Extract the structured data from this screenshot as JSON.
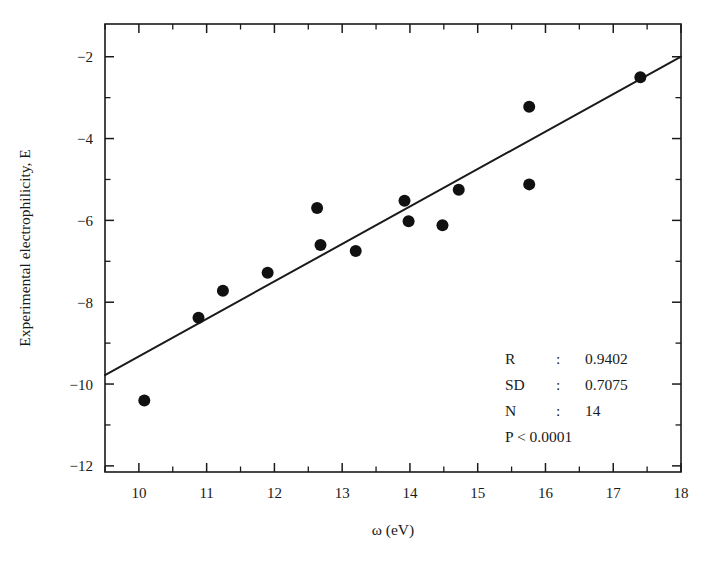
{
  "chart_data": {
    "type": "scatter",
    "title": "",
    "xlabel": "ω (eV)",
    "ylabel": "Experimental electrophilicity, E",
    "xlim": [
      9.5,
      18.0
    ],
    "ylim": [
      -12.15,
      -1.2
    ],
    "grid": false,
    "legend": "none",
    "xticks": [
      10,
      11,
      12,
      13,
      14,
      15,
      16,
      17,
      18
    ],
    "xtick_labels": [
      "10",
      "11",
      "12",
      "13",
      "14",
      "15",
      "16",
      "17",
      "18"
    ],
    "xminor_step": 0.5,
    "yticks": [
      -2,
      -4,
      -6,
      -8,
      -10,
      -12
    ],
    "ytick_labels": [
      "−2",
      "−4",
      "−6",
      "−8",
      "−10",
      "−12"
    ],
    "yminor_step": 1,
    "marker": "filled-circle",
    "marker_color": "#111111",
    "line_color": "#1a1a1a",
    "series": [
      {
        "name": "Experimental vs ω",
        "points": [
          {
            "x": 10.08,
            "y": -10.4
          },
          {
            "x": 10.88,
            "y": -8.38
          },
          {
            "x": 11.24,
            "y": -7.72
          },
          {
            "x": 11.9,
            "y": -7.28
          },
          {
            "x": 12.63,
            "y": -5.7
          },
          {
            "x": 12.68,
            "y": -6.6
          },
          {
            "x": 13.2,
            "y": -6.75
          },
          {
            "x": 13.92,
            "y": -5.52
          },
          {
            "x": 13.98,
            "y": -6.02
          },
          {
            "x": 14.48,
            "y": -6.12
          },
          {
            "x": 14.72,
            "y": -5.25
          },
          {
            "x": 15.76,
            "y": -3.22
          },
          {
            "x": 15.76,
            "y": -5.12
          },
          {
            "x": 17.4,
            "y": -2.5
          }
        ]
      }
    ],
    "fit_line": {
      "name": "linear regression",
      "x_start": 9.5,
      "y_start": -9.78,
      "x_end": 18.0,
      "y_end": -2.0
    }
  },
  "stats": {
    "rows": [
      {
        "label": "R",
        "sep": ":",
        "value": "0.9402"
      },
      {
        "label": "SD",
        "sep": ":",
        "value": "0.7075"
      },
      {
        "label": "N",
        "sep": ":",
        "value": "14"
      }
    ],
    "pvalue": "P < 0.0001"
  }
}
